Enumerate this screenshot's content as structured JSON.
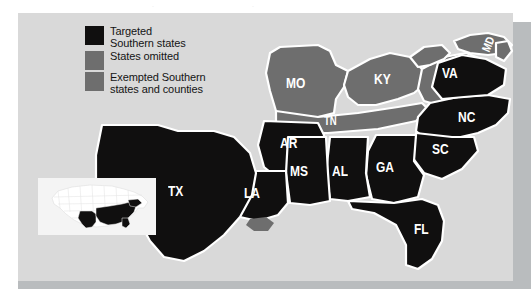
{
  "figure": {
    "background_color": "#d9d9d9",
    "panel_shadow_color": "#b9bcbe"
  },
  "legend": {
    "items": [
      {
        "label": "Targeted\nSouthern states",
        "line1": "Targeted",
        "line2": "Southern states",
        "color": "#100f0f",
        "swatch_name": "targeted"
      },
      {
        "label": "States omitted",
        "line1": "States omitted",
        "line2": "",
        "color": "#6e6e6e",
        "swatch_name": "omitted"
      },
      {
        "label": "Exempted Southern\nstates and counties",
        "line1": "Exempted Southern",
        "line2": "states and counties",
        "color": "#6e6e6e",
        "swatch_name": "exempted"
      }
    ]
  },
  "map": {
    "targeted_color": "#100f0f",
    "omitted_color": "#6e6e6e",
    "exempted_color": "#6e6e6e",
    "border_color": "#ffffff",
    "state_labels": [
      {
        "abbr": "MO",
        "category": "omitted"
      },
      {
        "abbr": "KY",
        "category": "omitted"
      },
      {
        "abbr": "VA",
        "category": "exempted"
      },
      {
        "abbr": "MD",
        "category": "omitted"
      },
      {
        "abbr": "NC",
        "category": "targeted"
      },
      {
        "abbr": "TN",
        "category": "omitted"
      },
      {
        "abbr": "AR",
        "category": "targeted"
      },
      {
        "abbr": "SC",
        "category": "targeted"
      },
      {
        "abbr": "GA",
        "category": "targeted"
      },
      {
        "abbr": "AL",
        "category": "targeted"
      },
      {
        "abbr": "MS",
        "category": "targeted"
      },
      {
        "abbr": "LA",
        "category": "targeted"
      },
      {
        "abbr": "TX",
        "category": "targeted"
      },
      {
        "abbr": "FL",
        "category": "targeted"
      }
    ]
  },
  "inset": {
    "background_color": "#f4f4f4",
    "states_color": "#ffffff",
    "highlight_color": "#100f0f"
  }
}
